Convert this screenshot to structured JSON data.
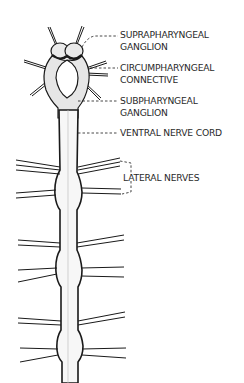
{
  "diagram": {
    "colors": {
      "line": "#1a1a1a",
      "fill": "#ffffff",
      "shade": "#c8c8c8",
      "text": "#2a2a2a"
    },
    "labels": [
      {
        "id": "suprapharyngeal",
        "lines": [
          "SUPRAPHARYNGEAL",
          "GANGLION"
        ]
      },
      {
        "id": "circumpharyngeal",
        "lines": [
          "CIRCUMPHARYNGEAL",
          "CONNECTIVE"
        ]
      },
      {
        "id": "subpharyngeal",
        "lines": [
          "SUBPHARYNGEAL",
          "GANGLION"
        ]
      },
      {
        "id": "ventral",
        "lines": [
          "VENTRAL NERVE CORD"
        ]
      },
      {
        "id": "lateral",
        "lines": [
          "LATERAL NERVES"
        ]
      }
    ]
  }
}
